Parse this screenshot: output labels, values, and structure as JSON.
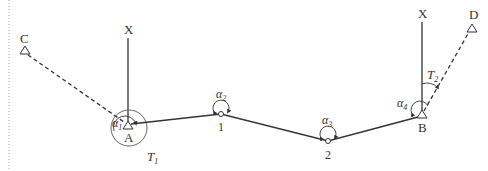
{
  "diagram": {
    "colors": {
      "line": "#333333",
      "dashed": "#333333",
      "margin_dots": "#999999",
      "background": "#ffffff"
    },
    "points": {
      "C": {
        "label": "C",
        "type": "known-control-triangle",
        "x": 25,
        "y": 52
      },
      "A": {
        "label": "A",
        "type": "known-control-triangle",
        "x": 128,
        "y": 126
      },
      "P1": {
        "label": "1",
        "type": "traverse-station-circle",
        "x": 221,
        "y": 114
      },
      "P2": {
        "label": "2",
        "type": "traverse-station-circle",
        "x": 328,
        "y": 141
      },
      "B": {
        "label": "B",
        "type": "known-control-triangle",
        "x": 422,
        "y": 115
      },
      "D": {
        "label": "D",
        "type": "known-control-triangle",
        "x": 472,
        "y": 27
      }
    },
    "north_lines": [
      {
        "label": "X",
        "at": "A"
      },
      {
        "label": "X",
        "at": "B"
      }
    ],
    "angles": {
      "alpha1": {
        "symbol": "α",
        "sub": "1"
      },
      "alpha2": {
        "symbol": "α",
        "sub": "2"
      },
      "alpha3": {
        "symbol": "α",
        "sub": "3"
      },
      "alpha4": {
        "symbol": "α",
        "sub": "4"
      }
    },
    "azimuths": {
      "T1": {
        "symbol": "T",
        "sub": "1"
      },
      "T2": {
        "symbol": "T",
        "sub": "2"
      }
    },
    "legs": [
      {
        "from": "C",
        "to": "A",
        "style": "dashed"
      },
      {
        "from": "A",
        "to": "P1",
        "style": "solid"
      },
      {
        "from": "P1",
        "to": "P2",
        "style": "solid"
      },
      {
        "from": "P2",
        "to": "B",
        "style": "solid"
      },
      {
        "from": "B",
        "to": "D",
        "style": "dashed"
      }
    ]
  }
}
